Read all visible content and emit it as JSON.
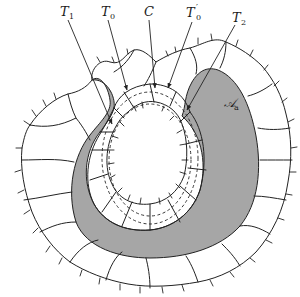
{
  "figure": {
    "colors": {
      "background": "#ffffff",
      "shaded_region": "#a6a6a6",
      "lines": "#222222"
    },
    "labels": [
      {
        "id": "T1",
        "main": "T",
        "sub": "1",
        "prime": ""
      },
      {
        "id": "T0",
        "main": "T",
        "sub": "0",
        "prime": ""
      },
      {
        "id": "C",
        "main": "C",
        "sub": "",
        "prime": ""
      },
      {
        "id": "T0prime",
        "main": "T",
        "sub": "0",
        "prime": "′"
      },
      {
        "id": "T2",
        "main": "T",
        "sub": "2",
        "prime": ""
      },
      {
        "id": "Aa",
        "main": "𝒜",
        "sub": "a",
        "prime": ""
      }
    ]
  }
}
